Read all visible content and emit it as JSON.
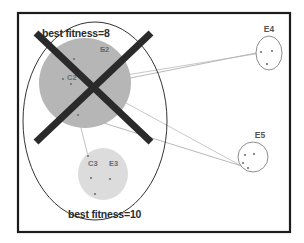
{
  "figure": {
    "background_color": "#ffffff",
    "frame": {
      "name": "outer-frame",
      "stroke": "#1c1c1c",
      "x": 18,
      "y": 13,
      "width": 272,
      "height": 219
    },
    "annotations": {
      "top_fitness_label": "best fitness=8",
      "bottom_fitness_label": "best fitness=10"
    },
    "big_ellipse": {
      "name": "enclosing-population-ellipse",
      "stroke": "#333333",
      "cx": 95,
      "cy": 121,
      "rx": 72,
      "ry": 99
    },
    "cross_mark": {
      "name": "cross-out-mark",
      "color": "#2a2a2a",
      "stroke_width": 7,
      "x1": 36,
      "y1": 33,
      "x2": 151,
      "y2": 142
    },
    "clusters": [
      {
        "id": "upper-gray-cluster",
        "label": "",
        "fill": "#b6b6b6",
        "cx": 85,
        "cy": 83,
        "rx": 46,
        "ry": 45,
        "inner_labels": [
          {
            "text": "C2",
            "x": 67,
            "y": 80
          },
          {
            "text": "E2",
            "x": 100,
            "y": 52
          }
        ],
        "points": [
          {
            "x": 74,
            "y": 59
          },
          {
            "x": 104,
            "y": 50
          },
          {
            "x": 95,
            "y": 85
          },
          {
            "x": 71,
            "y": 84
          },
          {
            "x": 78,
            "y": 115
          },
          {
            "x": 63,
            "y": 79
          }
        ]
      },
      {
        "id": "lower-gray-cluster",
        "label": "",
        "fill": "#dcdcdc",
        "cx": 103,
        "cy": 174,
        "rx": 25,
        "ry": 26,
        "inner_labels": [
          {
            "text": "C3",
            "x": 88,
            "y": 166
          },
          {
            "text": "E3",
            "x": 109,
            "y": 166
          }
        ],
        "points": [
          {
            "x": 88,
            "y": 156
          },
          {
            "x": 91,
            "y": 178
          },
          {
            "x": 110,
            "y": 179
          },
          {
            "x": 95,
            "y": 194
          }
        ]
      },
      {
        "id": "cluster-e4",
        "label": "E4",
        "label_x": 269,
        "label_y": 32,
        "fill": "#ffffff",
        "cx": 269,
        "cy": 53,
        "rx": 13,
        "ry": 17,
        "inner_labels": [],
        "points": [
          {
            "x": 261,
            "y": 52
          },
          {
            "x": 272,
            "y": 51
          },
          {
            "x": 267,
            "y": 64
          }
        ]
      },
      {
        "id": "cluster-e5",
        "label": "E5",
        "label_x": 260,
        "label_y": 138,
        "fill": "#ffffff",
        "cx": 253,
        "cy": 157,
        "rx": 15,
        "ry": 15,
        "inner_labels": [],
        "points": [
          {
            "x": 245,
            "y": 155
          },
          {
            "x": 254,
            "y": 154
          },
          {
            "x": 243,
            "y": 163
          },
          {
            "x": 248,
            "y": 168
          }
        ]
      }
    ],
    "connectors": [
      {
        "name": "link-upper-to-e4",
        "x1": 95,
        "y1": 85,
        "x2": 261,
        "y2": 52,
        "stroke": "#9a9a9a"
      },
      {
        "name": "link-upper-to-e4-alt",
        "x1": 71,
        "y1": 84,
        "x2": 261,
        "y2": 53,
        "stroke": "#b0b0b0"
      },
      {
        "name": "link-upper-to-e5",
        "x1": 78,
        "y1": 115,
        "x2": 248,
        "y2": 168,
        "stroke": "#9a9a9a"
      },
      {
        "name": "link-upper-to-e5-alt",
        "x1": 95,
        "y1": 86,
        "x2": 247,
        "y2": 169,
        "stroke": "#b0b0b0"
      },
      {
        "name": "link-upper-to-lower",
        "x1": 78,
        "y1": 116,
        "x2": 88,
        "y2": 156,
        "stroke": "#a8a8a8"
      }
    ]
  }
}
